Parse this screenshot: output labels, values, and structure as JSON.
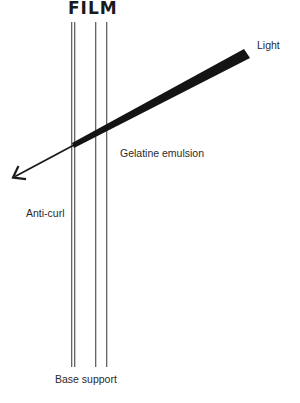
{
  "title": "FILM",
  "labels": {
    "light": "Light",
    "gelatine": "Gelatine emulsion",
    "anticurl": "Anti-curl",
    "base": "Base support"
  },
  "layers": [
    {
      "name": "anti-curl",
      "x_left": 71.5,
      "x_right": 74.5
    },
    {
      "name": "base-support",
      "x_left": 74.5,
      "x_right": 95.5
    },
    {
      "name": "gelatine-emulsion",
      "x_left": 95.5,
      "x_right": 106.5
    }
  ],
  "colors": {
    "ink": "#1a1a1a",
    "line": "#444444",
    "background": "#ffffff"
  }
}
